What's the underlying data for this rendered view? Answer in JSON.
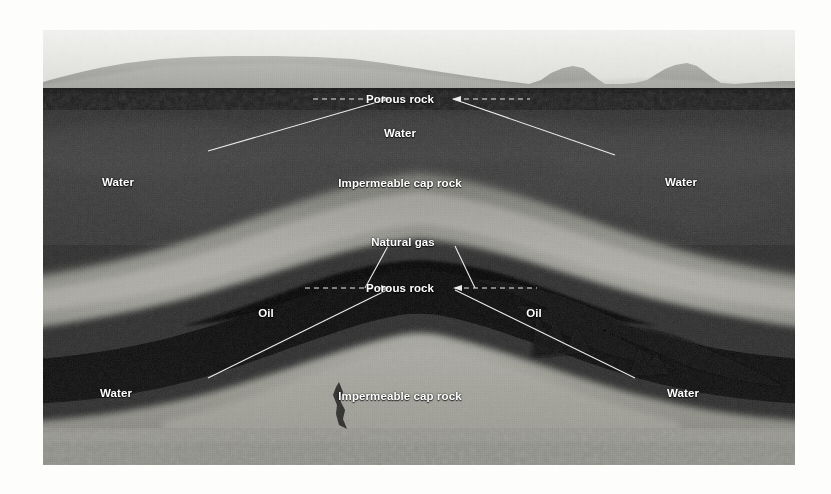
{
  "figure": {
    "type": "geological-cross-section",
    "plate": {
      "left": 43,
      "top": 30,
      "width": 752,
      "height": 435
    },
    "background_color": "#f7f7f5",
    "label_color": "#ffffff",
    "leader_color": "#e8e8e6",
    "labels": [
      {
        "id": "porous-rock-top",
        "text": "Porous rock",
        "x": 400,
        "y": 99
      },
      {
        "id": "water-upper-center",
        "text": "Water",
        "x": 400,
        "y": 133
      },
      {
        "id": "water-left-upper",
        "text": "Water",
        "x": 118,
        "y": 182
      },
      {
        "id": "water-right-upper",
        "text": "Water",
        "x": 681,
        "y": 182
      },
      {
        "id": "cap-rock-upper",
        "text": "Impermeable cap rock",
        "x": 400,
        "y": 183
      },
      {
        "id": "natural-gas",
        "text": "Natural gas",
        "x": 403,
        "y": 242
      },
      {
        "id": "porous-rock-mid",
        "text": "Porous rock",
        "x": 400,
        "y": 288
      },
      {
        "id": "oil-left",
        "text": "Oil",
        "x": 266,
        "y": 313
      },
      {
        "id": "oil-right",
        "text": "Oil",
        "x": 534,
        "y": 313
      },
      {
        "id": "water-left-lower",
        "text": "Water",
        "x": 116,
        "y": 393
      },
      {
        "id": "water-right-lower",
        "text": "Water",
        "x": 683,
        "y": 393
      },
      {
        "id": "cap-rock-lower",
        "text": "Impermeable cap rock",
        "x": 400,
        "y": 396
      }
    ],
    "strata": [
      {
        "name": "sky",
        "color": "#e6e6e4"
      },
      {
        "name": "distant-mountains",
        "color": "#a6a6a3"
      },
      {
        "name": "surface-dark-band",
        "color": "#1c1c1c"
      },
      {
        "name": "porous-rock-upper",
        "color": "#3a3a3a"
      },
      {
        "name": "impermeable-cap-rock",
        "color": "#8d8d88"
      },
      {
        "name": "natural-gas-zone",
        "color": "#050505"
      },
      {
        "name": "oil-zone",
        "color": "#070707"
      },
      {
        "name": "porous-rock-lower",
        "color": "#333333"
      },
      {
        "name": "impermeable-base",
        "color": "#9a9a94"
      },
      {
        "name": "basement",
        "color": "#8a8a85"
      }
    ]
  }
}
